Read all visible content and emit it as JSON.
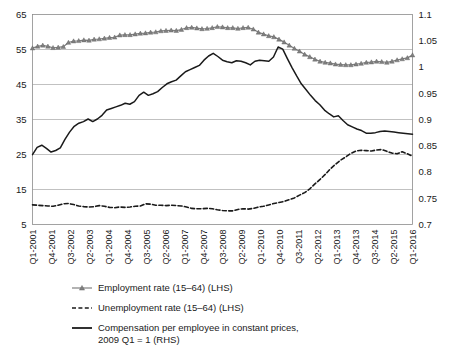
{
  "chart_data": {
    "type": "line",
    "title": "",
    "xlabel": "",
    "ylabel": "",
    "grid": true,
    "legend_position": "bottom",
    "left_axis": {
      "label": "",
      "ylim": [
        5,
        65
      ],
      "ticks": [
        "5",
        "15",
        "25",
        "35",
        "45",
        "55",
        "65"
      ],
      "tick_values": [
        5,
        15,
        25,
        35,
        45,
        55,
        65
      ]
    },
    "right_axis": {
      "label": "",
      "ylim": [
        0.7,
        1.1
      ],
      "ticks": [
        "0.7",
        "0.75",
        "0.8",
        "0.85",
        "0.9",
        "0.95",
        "1",
        "1.05",
        "1.1"
      ],
      "tick_values": [
        0.7,
        0.75,
        0.8,
        0.85,
        0.9,
        0.95,
        1.0,
        1.05,
        1.1
      ]
    },
    "x_tick_labels": [
      "Q1-2001",
      "Q4-2001",
      "Q3-2002",
      "Q2-2003",
      "Q1-2004",
      "Q4-2004",
      "Q3-2005",
      "Q2-2006",
      "Q1-2007",
      "Q4-2007",
      "Q3-2008",
      "Q2-2009",
      "Q1-2010",
      "Q4-2010",
      "Q3-2011",
      "Q2-2012",
      "Q1-2013",
      "Q4-2013",
      "Q3-2014",
      "Q2-2015",
      "Q1-2016"
    ],
    "x_tick_indices": [
      0,
      3,
      6,
      9,
      12,
      15,
      18,
      21,
      24,
      27,
      30,
      33,
      36,
      39,
      42,
      45,
      48,
      51,
      54,
      57,
      60
    ],
    "x_count": 61,
    "series": [
      {
        "name": "Employment rate (15–64) (LHS)",
        "axis": "left",
        "style": "solid-marker",
        "color": "#808080",
        "marker": "triangle",
        "values": [
          55.4,
          55.9,
          56.2,
          55.9,
          55.5,
          55.6,
          55.8,
          57.0,
          57.4,
          57.5,
          57.7,
          57.6,
          57.9,
          58.0,
          58.2,
          58.4,
          58.5,
          59.1,
          59.2,
          59.2,
          59.4,
          59.6,
          59.7,
          59.9,
          60.0,
          60.3,
          60.4,
          60.5,
          60.4,
          60.7,
          61.2,
          61.3,
          61.1,
          60.9,
          61.0,
          61.2,
          61.5,
          61.4,
          61.2,
          61.2,
          61.0,
          61.2,
          61.3,
          60.8,
          59.9,
          59.4,
          58.9,
          58.6,
          57.9,
          57.1,
          56.2,
          55.3,
          54.5,
          53.6,
          52.9,
          52.2,
          51.6,
          51.3,
          51.1,
          50.8,
          50.7,
          50.6,
          50.6,
          50.8,
          51.0,
          51.3,
          51.4,
          51.6,
          51.5,
          51.3,
          51.6,
          52.0,
          52.3,
          52.6,
          53.4
        ]
      },
      {
        "name": "Unemployment rate (15–64) (LHS)",
        "axis": "left",
        "style": "dashed",
        "color": "#1a1a1a",
        "values": [
          10.6,
          10.5,
          10.4,
          10.3,
          10.2,
          10.5,
          10.9,
          11.0,
          10.7,
          10.3,
          10.1,
          10.0,
          10.1,
          10.4,
          10.2,
          9.9,
          9.8,
          10.0,
          9.9,
          10.0,
          10.2,
          10.3,
          10.9,
          10.8,
          10.5,
          10.5,
          10.4,
          10.5,
          10.4,
          10.3,
          10.0,
          9.6,
          9.5,
          9.5,
          9.6,
          9.5,
          9.2,
          9.0,
          8.9,
          8.9,
          9.3,
          9.5,
          9.4,
          9.6,
          10.0,
          10.2,
          10.6,
          11.0,
          11.3,
          11.6,
          12.1,
          12.6,
          13.4,
          14.1,
          15.2,
          16.6,
          17.9,
          19.3,
          20.9,
          22.2,
          23.4,
          24.3,
          25.3,
          26.0,
          26.2,
          26.1,
          26.0,
          26.3,
          26.4,
          25.9,
          25.4,
          25.2,
          25.8,
          25.2,
          24.5
        ]
      },
      {
        "name": "Compensation per employee in constant prices, 2009 Q1 = 1 (RHS)",
        "axis": "right",
        "style": "solid",
        "color": "#1a1a1a",
        "values": [
          0.833,
          0.847,
          0.851,
          0.845,
          0.838,
          0.841,
          0.846,
          0.862,
          0.876,
          0.887,
          0.893,
          0.896,
          0.901,
          0.896,
          0.901,
          0.908,
          0.918,
          0.921,
          0.924,
          0.927,
          0.931,
          0.929,
          0.934,
          0.946,
          0.952,
          0.946,
          0.949,
          0.953,
          0.961,
          0.968,
          0.972,
          0.975,
          0.983,
          0.991,
          0.995,
          0.999,
          1.003,
          1.013,
          1.021,
          1.026,
          1.02,
          1.013,
          1.01,
          1.008,
          1.012,
          1.011,
          1.008,
          1.004,
          1.011,
          1.013,
          1.012,
          1.011,
          1.019,
          1.038,
          1.034,
          1.016,
          0.999,
          0.983,
          0.968,
          0.957,
          0.946,
          0.936,
          0.928,
          0.918,
          0.911,
          0.905,
          0.907,
          0.898,
          0.89,
          0.886,
          0.882,
          0.879,
          0.874,
          0.874,
          0.875,
          0.877,
          0.878,
          0.877,
          0.876,
          0.875,
          0.874,
          0.873,
          0.872
        ]
      }
    ]
  },
  "legend": {
    "items": [
      {
        "key": "employment-rate",
        "label": "Employment rate (15–64) (LHS)",
        "label2": "",
        "style": "solid-marker",
        "color": "#808080"
      },
      {
        "key": "unemployment-rate",
        "label": "Unemployment rate (15–64) (LHS)",
        "label2": "",
        "style": "dashed",
        "color": "#1a1a1a"
      },
      {
        "key": "compensation-per-employee",
        "label": "Compensation per employee in constant prices,",
        "label2": "2009 Q1 = 1 (RHS)",
        "style": "solid",
        "color": "#1a1a1a"
      }
    ]
  },
  "colors": {
    "employment": "#808080",
    "unemployment": "#1a1a1a",
    "compensation": "#1a1a1a",
    "grid": "#a6a6a6",
    "frame": "#8c8c8c",
    "background": "#ffffff"
  }
}
